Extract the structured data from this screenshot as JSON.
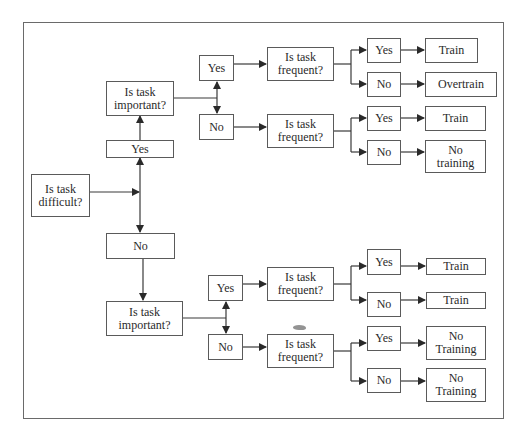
{
  "diagram": {
    "type": "decision-tree",
    "root": {
      "label": "Is task\ndifficult?",
      "branches": [
        {
          "answer": "Yes",
          "question": "Is task\nimportant?",
          "branches": [
            {
              "answer": "Yes",
              "question": "Is task\nfrequent?",
              "branches": [
                {
                  "answer": "Yes",
                  "outcome": "Train"
                },
                {
                  "answer": "No",
                  "outcome": "Overtrain"
                }
              ]
            },
            {
              "answer": "No",
              "question": "Is task\nfrequent?",
              "branches": [
                {
                  "answer": "Yes",
                  "outcome": "Train"
                },
                {
                  "answer": "No",
                  "outcome": "No\ntraining"
                }
              ]
            }
          ]
        },
        {
          "answer": "No",
          "question": "Is task\nimportant?",
          "branches": [
            {
              "answer": "Yes",
              "question": "Is task\nfrequent?",
              "branches": [
                {
                  "answer": "Yes",
                  "outcome": "Train"
                },
                {
                  "answer": "No",
                  "outcome": "Train"
                }
              ]
            },
            {
              "answer": "No",
              "question": "Is task\nfrequent?",
              "branches": [
                {
                  "answer": "Yes",
                  "outcome": "No\nTraining"
                },
                {
                  "answer": "No",
                  "outcome": "No\nTraining"
                }
              ]
            }
          ]
        }
      ]
    }
  },
  "nodes": {
    "difficult": "Is task\ndifficult?",
    "yes_difficult": "Yes",
    "no_difficult": "No",
    "important_top": "Is task\nimportant?",
    "important_bottom": "Is task\nimportant?",
    "top_yes": "Yes",
    "top_no": "No",
    "bottom_yes": "Yes",
    "bottom_no": "No",
    "freq_1": "Is task\nfrequent?",
    "freq_2": "Is task\nfrequent?",
    "freq_3": "Is task\nfrequent?",
    "freq_4": "Is task\nfrequent?",
    "f1_yes": "Yes",
    "f1_no": "No",
    "f2_yes": "Yes",
    "f2_no": "No",
    "f3_yes": "Yes",
    "f3_no": "No",
    "f4_yes": "Yes",
    "f4_no": "No",
    "out_1": "Train",
    "out_2": "Overtrain",
    "out_3": "Train",
    "out_4": "No\ntraining",
    "out_5": "Train",
    "out_6": "Train",
    "out_7": "No\nTraining",
    "out_8": "No\nTraining"
  },
  "colors": {
    "line": "#3a3a3a",
    "border": "#5a5a5a",
    "background": "#ffffff"
  }
}
